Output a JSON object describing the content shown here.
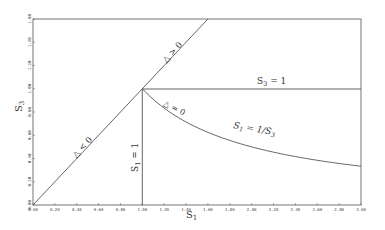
{
  "chart_data": {
    "type": "line",
    "title": "",
    "xlabel": "S1",
    "ylabel": "S3",
    "xlim": [
      0,
      3.0
    ],
    "ylim": [
      0,
      1.6
    ],
    "grid": false,
    "legend": null,
    "x_ticks": [
      "0.00",
      "0.20",
      "0.40",
      "0.60",
      "0.80",
      "1.00",
      "1.20",
      "1.40",
      "1.60",
      "1.80",
      "2.00",
      "2.20",
      "2.40",
      "2.60",
      "2.80",
      "3.00"
    ],
    "y_ticks": [
      "0.00",
      "0.20",
      "0.40",
      "0.60",
      "0.80",
      "1.00",
      "1.20",
      "1.40",
      "1.60"
    ],
    "series": [
      {
        "name": "S3 = S1 (diagonal)",
        "points": [
          [
            0,
            0
          ],
          [
            1.6,
            1.6
          ]
        ]
      },
      {
        "name": "S1 = 1",
        "points": [
          [
            1,
            0
          ],
          [
            1,
            1
          ]
        ]
      },
      {
        "name": "S3 = 1",
        "points": [
          [
            1,
            1
          ],
          [
            3,
            1
          ]
        ]
      },
      {
        "name": "S1 = 1/S3",
        "points": [
          [
            1,
            1
          ],
          [
            1.25,
            0.8
          ],
          [
            1.5,
            0.667
          ],
          [
            1.75,
            0.571
          ],
          [
            2,
            0.5
          ],
          [
            2.25,
            0.444
          ],
          [
            2.5,
            0.4
          ],
          [
            2.75,
            0.364
          ],
          [
            3,
            0.333
          ]
        ]
      }
    ],
    "annotations": [
      {
        "text": "Δ < 0",
        "x": 0.5,
        "y": 0.55
      },
      {
        "text": "Δ > 0",
        "x": 1.28,
        "y": 1.32
      },
      {
        "text": "Δ = 0",
        "x": 1.12,
        "y": 0.9
      },
      {
        "text": "S3 = 1",
        "x": 2.1,
        "y": 1.04
      },
      {
        "text": "S1 = 1/S3",
        "x": 2.1,
        "y": 0.62
      },
      {
        "text": "S1 = 1",
        "x": 0.94,
        "y": 0.4
      }
    ]
  },
  "labels": {
    "xlabel_main": "S",
    "xlabel_sub": "1",
    "ylabel_main": "S",
    "ylabel_sub": "3",
    "delta_neg": "△ < 0",
    "delta_pos": "△ > 0",
    "delta_zero": "△ = 0",
    "s3_eq_1_main": "S",
    "s3_eq_1_sub": "3",
    "s3_eq_1_rest": " = 1",
    "s1_inv_main": "S",
    "s1_inv_sub": "1",
    "s1_inv_rest": " = 1/S",
    "s1_inv_sub2": "3",
    "s1_eq_1_main": "S",
    "s1_eq_1_sub": "1",
    "s1_eq_1_rest": " = 1"
  }
}
